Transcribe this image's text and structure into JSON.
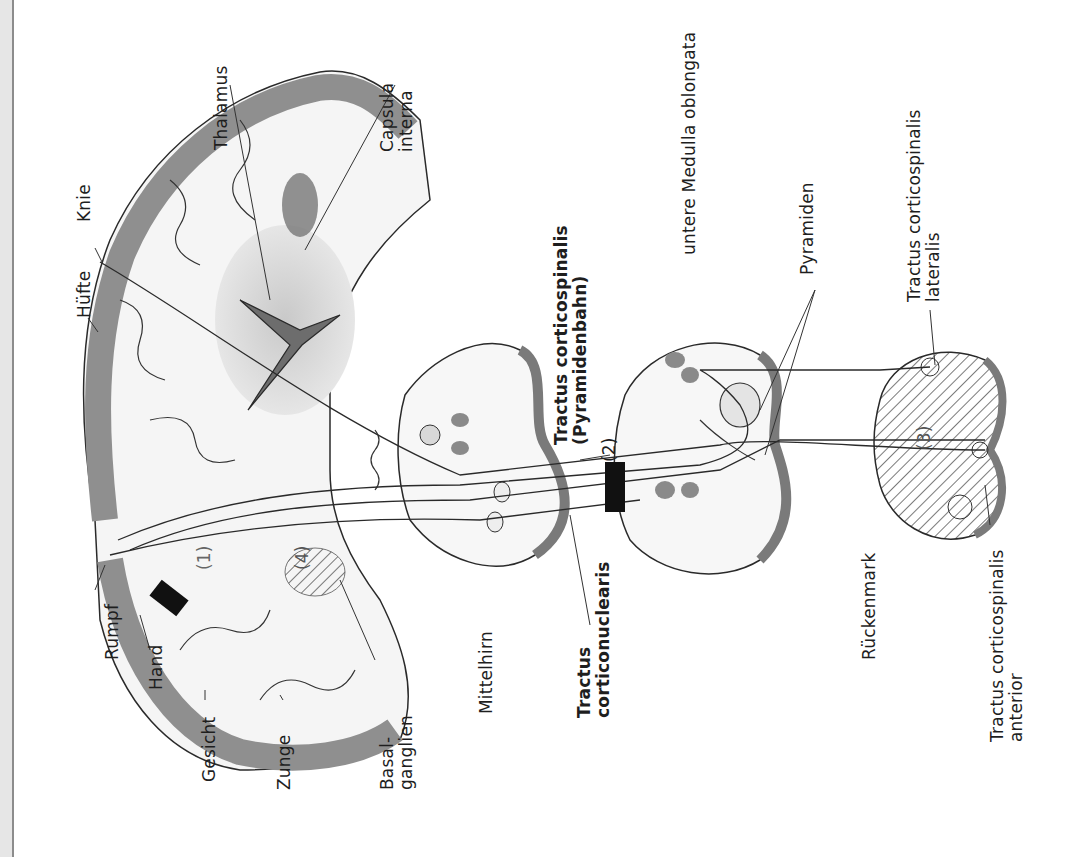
{
  "figure": {
    "orientation": "rotated-90-ccw",
    "labels": {
      "knie": "Knie",
      "huefte": "Hüfte",
      "rumpf": "Rumpf",
      "hand": "Hand",
      "gesicht": "Gesicht",
      "zunge": "Zunge",
      "basalganglien": "Basal-\nganglien",
      "thalamus": "Thalamus",
      "capsula_interna": "Capsula\ninterna",
      "mittelhirn": "Mittelhirn",
      "tractus_corticonuclearis": "Tractus\ncorticonuclearis",
      "tractus_corticospinalis": "Tractus corticospinalis\n(Pyramidenbahn)",
      "untere_medulla": "untere Medulla oblongata",
      "pyramiden": "Pyramiden",
      "rueckenmark": "Rückenmark",
      "tractus_cs_lateralis": "Tractus corticospinalis\nlateralis",
      "tractus_cs_anterior": "Tractus corticospinalis\nanterior"
    },
    "lesion_markers": [
      "(1)",
      "(2)",
      "(3)",
      "(4)"
    ],
    "colors": {
      "gray_matter": "#8f8f8f",
      "white_matter": "#f4f4f4",
      "lesion_block": "#111111",
      "outline": "#2a2a2a",
      "margin": "#e6e6e6"
    }
  }
}
